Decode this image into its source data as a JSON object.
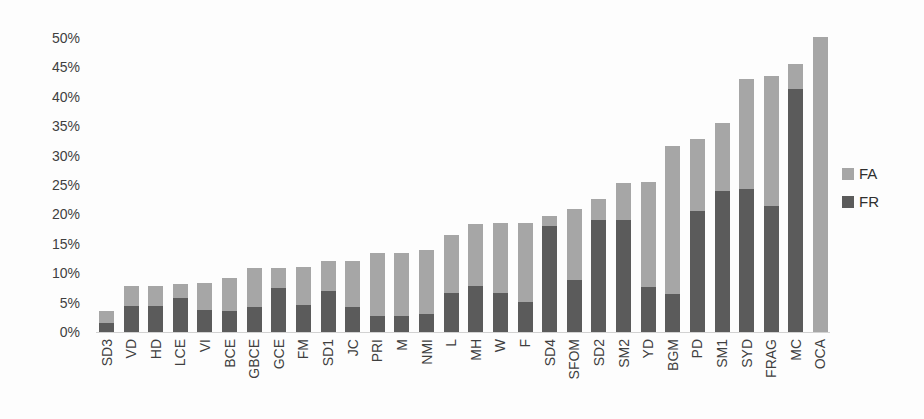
{
  "chart_data": {
    "type": "bar",
    "stacked": true,
    "title": "",
    "xlabel": "",
    "ylabel": "",
    "grid": false,
    "ylim": [
      0,
      50
    ],
    "ytick_step": 5,
    "ytick_labels": [
      "0%",
      "5%",
      "10%",
      "15%",
      "20%",
      "25%",
      "30%",
      "35%",
      "40%",
      "45%",
      "50%"
    ],
    "categories": [
      "SD3",
      "VD",
      "HD",
      "LCE",
      "VI",
      "BCE",
      "GBCE",
      "GCE",
      "FM",
      "SD1",
      "JC",
      "PRI",
      "M",
      "NMI",
      "L",
      "MH",
      "W",
      "F",
      "SD4",
      "SFOM",
      "SD2",
      "SM2",
      "YD",
      "BGM",
      "PD",
      "SM1",
      "SYD",
      "FRAG",
      "MC",
      "OCA"
    ],
    "series": [
      {
        "name": "FR",
        "color": "#5b5b5b",
        "values": [
          1.5,
          4.4,
          4.4,
          5.7,
          3.8,
          3.6,
          4.2,
          7.4,
          4.6,
          6.9,
          4.3,
          2.7,
          2.7,
          3.0,
          6.6,
          7.9,
          6.6,
          5.1,
          18.0,
          8.8,
          19.0,
          19.0,
          7.6,
          6.5,
          20.6,
          23.9,
          24.4,
          21.4,
          41.3,
          0.0
        ]
      },
      {
        "name": "FA",
        "color": "#a6a6a6",
        "values": [
          2.1,
          3.4,
          3.4,
          2.5,
          4.5,
          5.6,
          6.6,
          3.4,
          6.4,
          5.1,
          7.7,
          10.7,
          10.7,
          11.0,
          9.9,
          10.4,
          12.0,
          13.5,
          1.7,
          12.2,
          3.7,
          6.3,
          17.9,
          25.1,
          12.3,
          11.6,
          18.6,
          22.1,
          4.2,
          50.2
        ]
      }
    ],
    "legend": {
      "position": "right",
      "entries": [
        "FA",
        "FR"
      ]
    }
  },
  "colors": {
    "fa": "#a6a6a6",
    "fr": "#5b5b5b",
    "text": "#3f3f3f",
    "background": "#fdfdfd"
  }
}
